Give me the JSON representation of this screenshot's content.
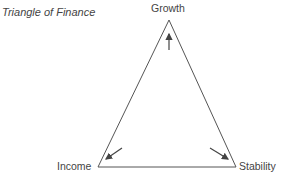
{
  "diagram": {
    "title": "Triangle of Finance",
    "type": "triangle",
    "vertices": [
      {
        "label": "Growth",
        "position": "top",
        "arrow_direction": "up"
      },
      {
        "label": "Income",
        "position": "bottom-left",
        "arrow_direction": "down-left"
      },
      {
        "label": "Stability",
        "position": "bottom-right",
        "arrow_direction": "down-right"
      }
    ],
    "colors": {
      "line": "#555555",
      "text": "#444444",
      "background": "#ffffff"
    }
  }
}
